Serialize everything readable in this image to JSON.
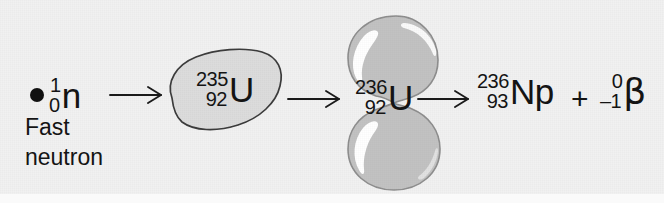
{
  "diagram": {
    "background_color": "#f1f1f1",
    "ink_color": "#141414",
    "nucleus_fill": "#c2c2c2",
    "nucleus_stroke": "#4a4a4a",
    "blob_fill": "#dcdcdc",
    "blob_stroke": "#3c3c3c",
    "highlight_color": "#ffffff"
  },
  "reactants": {
    "neutron": {
      "particle_name": "neutron-dot",
      "mass_number": "1",
      "charge_number": "0",
      "symbol": "n",
      "caption_line1": "Fast",
      "caption_line2": "neutron"
    },
    "uranium235": {
      "mass_number": "235",
      "charge_number": "92",
      "symbol": "U",
      "shape": "irregular-blob"
    }
  },
  "intermediate": {
    "uranium236": {
      "mass_number": "236",
      "charge_number": "92",
      "symbol": "U",
      "shape": "dumbbell-two-lobes"
    }
  },
  "products": {
    "neptunium236": {
      "mass_number": "236",
      "charge_number": "93",
      "symbol": "Np"
    },
    "operator": "+",
    "beta": {
      "mass_number": "0",
      "charge_number": "–1",
      "symbol": "β"
    }
  },
  "arrows": [
    {
      "name": "arrow-neutron-to-u235",
      "style": "open-head"
    },
    {
      "name": "arrow-u235-to-u236",
      "style": "open-head"
    },
    {
      "name": "arrow-u236-to-products",
      "style": "open-head"
    }
  ]
}
